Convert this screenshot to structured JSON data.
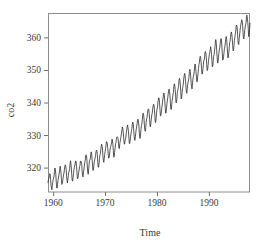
{
  "chart_data": {
    "type": "line",
    "title": "",
    "subtitle": "",
    "xlabel": "Time",
    "ylabel": "co2",
    "xlim": [
      1959.0,
      1997.92
    ],
    "ylim": [
      312.5,
      367.5
    ],
    "grid": false,
    "legend": "none",
    "xticks": [
      1960,
      1970,
      1980,
      1990
    ],
    "xtick_labels": [
      "1960",
      "1970",
      "1980",
      "1990"
    ],
    "yticks": [
      320,
      330,
      340,
      350,
      360
    ],
    "ytick_labels": [
      "320",
      "330",
      "340",
      "350",
      "360"
    ],
    "series": [
      {
        "name": "co2",
        "x_start": 1959.0,
        "x_step": 0.0833333,
        "values": [
          315.42,
          316.31,
          316.5,
          317.56,
          318.13,
          318.0,
          316.39,
          314.65,
          313.68,
          313.18,
          314.66,
          315.43,
          316.27,
          316.81,
          317.42,
          318.87,
          319.87,
          319.43,
          318.01,
          315.74,
          314.0,
          313.68,
          314.84,
          316.03,
          316.73,
          317.54,
          318.38,
          319.31,
          320.42,
          319.61,
          318.42,
          316.63,
          314.83,
          315.16,
          315.94,
          316.85,
          317.78,
          318.4,
          319.53,
          320.42,
          320.85,
          320.45,
          319.45,
          317.25,
          316.11,
          315.27,
          316.53,
          317.53,
          318.58,
          318.92,
          319.7,
          321.22,
          322.08,
          321.31,
          319.58,
          317.61,
          316.05,
          315.83,
          316.91,
          318.2,
          319.41,
          320.07,
          320.74,
          321.4,
          322.06,
          321.73,
          320.27,
          318.54,
          316.54,
          316.71,
          317.53,
          318.55,
          319.27,
          320.28,
          320.73,
          321.97,
          322.0,
          321.71,
          321.05,
          318.71,
          317.66,
          317.14,
          318.7,
          319.25,
          320.46,
          321.43,
          322.23,
          323.54,
          323.91,
          323.59,
          322.24,
          320.2,
          318.48,
          317.94,
          319.63,
          320.87,
          322.17,
          322.34,
          322.88,
          324.25,
          324.83,
          323.93,
          322.38,
          320.76,
          319.1,
          319.24,
          320.56,
          321.8,
          322.4,
          322.99,
          323.73,
          324.86,
          325.4,
          325.2,
          323.98,
          321.95,
          320.18,
          320.09,
          321.16,
          322.74,
          323.83,
          324.26,
          325.47,
          326.5,
          327.21,
          326.54,
          325.72,
          323.5,
          322.22,
          321.62,
          322.69,
          323.95,
          324.89,
          325.82,
          326.77,
          327.97,
          327.91,
          327.5,
          326.18,
          324.53,
          322.93,
          322.9,
          323.85,
          324.96,
          326.01,
          326.51,
          327.01,
          327.62,
          328.76,
          328.4,
          327.2,
          325.27,
          323.2,
          323.4,
          324.63,
          325.85,
          327.26,
          327.52,
          328.61,
          329.34,
          329.5,
          329.3,
          328.94,
          327.44,
          325.95,
          325.82,
          327.46,
          328.09,
          328.92,
          329.6,
          330.57,
          331.6,
          332.48,
          332.07,
          330.87,
          329.31,
          327.51,
          327.18,
          328.16,
          328.64,
          329.35,
          330.71,
          331.48,
          332.65,
          333.1,
          332.25,
          331.18,
          329.4,
          327.44,
          327.37,
          328.46,
          329.58,
          330.4,
          331.41,
          332.04,
          333.31,
          333.97,
          333.6,
          331.9,
          330.06,
          328.56,
          328.34,
          329.49,
          330.76,
          331.75,
          332.56,
          333.5,
          334.58,
          334.88,
          334.33,
          333.05,
          330.94,
          329.3,
          328.94,
          330.31,
          331.68,
          332.93,
          333.42,
          334.7,
          336.07,
          336.75,
          336.27,
          334.92,
          332.75,
          331.59,
          331.16,
          332.4,
          333.85,
          334.97,
          335.39,
          336.64,
          337.76,
          338.01,
          337.89,
          336.54,
          334.68,
          332.76,
          332.54,
          333.92,
          334.95,
          336.23,
          336.76,
          337.96,
          338.89,
          339.47,
          339.29,
          337.73,
          336.09,
          333.91,
          333.86,
          335.29,
          336.73,
          338.01,
          338.36,
          340.07,
          340.77,
          341.46,
          341.17,
          339.56,
          337.6,
          335.88,
          336.01,
          337.1,
          338.21,
          339.24,
          340.48,
          341.38,
          342.51,
          342.91,
          342.25,
          340.49,
          338.43,
          336.69,
          336.86,
          338.36,
          339.61,
          340.75,
          341.61,
          342.7,
          343.56,
          344.13,
          343.35,
          342.06,
          339.82,
          337.97,
          337.86,
          339.26,
          340.49,
          341.37,
          342.52,
          343.1,
          344.94,
          345.75,
          345.32,
          343.99,
          342.39,
          339.86,
          339.99,
          341.16,
          342.99,
          343.7,
          344.5,
          345.28,
          347.06,
          347.43,
          346.8,
          345.39,
          343.28,
          341.07,
          341.35,
          342.98,
          344.22,
          344.97,
          345.99,
          347.42,
          348.35,
          348.93,
          348.25,
          346.56,
          344.69,
          343.09,
          342.8,
          344.24,
          345.56,
          346.3,
          346.95,
          347.85,
          349.55,
          350.21,
          349.54,
          347.94,
          345.91,
          344.86,
          344.17,
          345.66,
          346.9,
          348.02,
          348.47,
          349.42,
          350.99,
          351.84,
          351.25,
          349.52,
          348.1,
          346.44,
          346.36,
          347.81,
          348.96,
          350.43,
          351.72,
          352.22,
          353.59,
          354.22,
          353.79,
          352.39,
          350.44,
          348.72,
          348.88,
          350.07,
          351.34,
          352.76,
          353.07,
          353.68,
          355.42,
          355.67,
          355.12,
          353.9,
          351.67,
          349.8,
          349.99,
          351.3,
          352.52,
          353.66,
          354.7,
          355.38,
          356.2,
          357.16,
          356.22,
          354.82,
          352.91,
          350.96,
          351.18,
          352.83,
          354.21,
          354.72,
          355.75,
          357.16,
          358.6,
          359.34,
          358.24,
          356.17,
          354.03,
          352.16,
          352.21,
          353.75,
          354.99,
          355.99,
          356.72,
          357.81,
          359.15,
          359.66,
          359.25,
          357.03,
          355.0,
          353.01,
          353.31,
          354.16,
          355.4,
          356.7,
          357.16,
          358.38,
          359.46,
          360.28,
          359.6,
          357.57,
          355.52,
          353.7,
          353.98,
          355.33,
          356.8,
          358.36,
          358.91,
          359.97,
          361.26,
          361.68,
          360.95,
          359.55,
          357.49,
          355.84,
          356.0,
          357.59,
          359.05,
          359.98,
          361.03,
          361.66,
          363.48,
          363.82,
          363.3,
          361.94,
          359.5,
          358.11,
          357.8,
          359.61,
          360.74,
          362.09,
          363.29,
          364.06,
          364.76,
          365.45,
          365.01,
          363.7,
          361.54,
          359.51,
          359.65,
          360.8,
          362.38,
          363.23,
          364.06,
          364.61,
          366.4,
          366.84,
          365.68,
          364.52,
          362.57,
          360.24,
          360.83,
          362.49,
          364.34
        ]
      }
    ]
  },
  "figure": {
    "plot_box": {
      "left": 48,
      "top": 13,
      "right": 250,
      "bottom": 192
    },
    "colors": {
      "line": "#2b2b2b",
      "frame": "#8c8c8c",
      "text": "#3a3a3a",
      "background": "#ffffff"
    }
  }
}
